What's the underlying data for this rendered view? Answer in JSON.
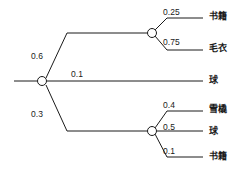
{
  "diagram": {
    "type": "probability-tree",
    "title": "",
    "root": {
      "label": "",
      "x": 42,
      "y": 81
    },
    "level1_branches": [
      {
        "probability": "0.6",
        "label_x": 31,
        "label_y": 52,
        "target": "node-upper"
      },
      {
        "probability": "0.1",
        "label_x": 71,
        "label_y": 70,
        "target": "leaf-ball-middle"
      },
      {
        "probability": "0.3",
        "label_x": 31,
        "label_y": 110,
        "target": "node-lower"
      }
    ],
    "upper_node": {
      "x": 152,
      "y": 33,
      "branches": [
        {
          "probability": "0.25",
          "leaf": "书籍",
          "prob_x": 163,
          "prob_y": 8,
          "leaf_x": 209,
          "leaf_y": 12
        },
        {
          "probability": "0.75",
          "leaf": "毛衣",
          "prob_x": 163,
          "prob_y": 38,
          "leaf_x": 209,
          "leaf_y": 44
        }
      ]
    },
    "middle_branch": {
      "probability": "0.1",
      "leaf": "球",
      "leaf_x": 209,
      "leaf_y": 76
    },
    "lower_node": {
      "x": 152,
      "y": 131,
      "branches": [
        {
          "probability": "0.4",
          "leaf": "雪橇",
          "prob_x": 163,
          "prob_y": 101,
          "leaf_x": 209,
          "leaf_y": 105
        },
        {
          "probability": "0.5",
          "leaf": "球",
          "prob_x": 163,
          "prob_y": 123,
          "leaf_x": 209,
          "leaf_y": 127
        },
        {
          "probability": "0.1",
          "leaf": "书籍",
          "prob_x": 163,
          "prob_y": 147,
          "leaf_x": 209,
          "leaf_y": 152
        }
      ]
    },
    "colors": {
      "stroke": "#1a1a1a",
      "background": "#ffffff",
      "text": "#1a1a1a"
    }
  }
}
